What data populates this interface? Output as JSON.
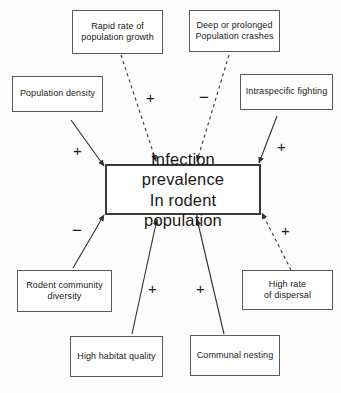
{
  "diagram": {
    "background_color": "#fdfdfd",
    "line_color": "#3a3a3a",
    "box_border_color": "#5a5a5a",
    "central": {
      "label": "Infection prevalence\nIn rodent population",
      "line1": "Infection prevalence",
      "line2": "In rodent population"
    },
    "nodes": [
      {
        "id": "rapid-rate",
        "label": "Rapid rate of\npopulation growth"
      },
      {
        "id": "deep-crashes",
        "label": "Deep or prolonged\nPopulation crashes"
      },
      {
        "id": "population-density",
        "label": "Population density"
      },
      {
        "id": "intraspecific-fighting",
        "label": "Intraspecific fighting"
      },
      {
        "id": "rodent-diversity",
        "label": "Rodent community\ndiversity"
      },
      {
        "id": "high-dispersal",
        "label": "High rate\nof dispersal"
      },
      {
        "id": "habitat-quality",
        "label": "High habitat quality"
      },
      {
        "id": "communal-nesting",
        "label": "Communal nesting"
      }
    ],
    "edges": [
      {
        "id": "edge-rapid-rate",
        "from": "rapid-rate",
        "to": "central",
        "style": "dashed",
        "sign": "+"
      },
      {
        "id": "edge-deep-crashes",
        "from": "deep-crashes",
        "to": "central",
        "style": "dashed",
        "sign": "−"
      },
      {
        "id": "edge-population-density",
        "from": "population-density",
        "to": "central",
        "style": "solid",
        "sign": "+"
      },
      {
        "id": "edge-intraspecific-fighting",
        "from": "intraspecific-fighting",
        "to": "central",
        "style": "solid",
        "sign": "+"
      },
      {
        "id": "edge-rodent-diversity",
        "from": "rodent-diversity",
        "to": "central",
        "style": "solid",
        "sign": "−"
      },
      {
        "id": "edge-habitat-quality",
        "from": "habitat-quality",
        "to": "central",
        "style": "solid",
        "sign": "+"
      },
      {
        "id": "edge-communal-nesting",
        "from": "communal-nesting",
        "to": "central",
        "style": "solid",
        "sign": "+"
      },
      {
        "id": "edge-high-dispersal",
        "from": "high-dispersal",
        "to": "central",
        "style": "dashed",
        "sign": "+"
      }
    ],
    "signs": {
      "rapid_rate": "+",
      "deep_crashes": "−",
      "population_density": "+",
      "intraspecific_fighting": "+",
      "rodent_diversity": "−",
      "habitat_quality": "+",
      "communal_nesting": "+",
      "high_dispersal": "+"
    }
  }
}
